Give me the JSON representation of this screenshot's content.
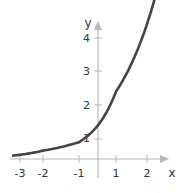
{
  "chart_data": {
    "type": "line",
    "title": "",
    "xlabel": "x",
    "ylabel": "y",
    "xlim": [
      -3.3,
      2.5
    ],
    "ylim": [
      0,
      4.3
    ],
    "grid": false,
    "x_ticks": [
      "-3",
      "-2",
      "-1",
      "1",
      "2"
    ],
    "y_ticks": [
      "1",
      "2",
      "3",
      "4"
    ],
    "series": [
      {
        "name": "y = 2^x",
        "color": "#444444",
        "x": [
          -3.3,
          -3,
          -2.5,
          -2,
          -1.5,
          -1,
          -0.5,
          0,
          0.5,
          1,
          1.5,
          2,
          2.3
        ],
        "values": [
          0.1,
          0.125,
          0.18,
          0.25,
          0.35,
          0.5,
          0.71,
          1,
          1.41,
          2,
          2.83,
          4,
          4.9
        ]
      }
    ]
  },
  "colors": {
    "axis": "#b8b8b8",
    "curve": "#444444",
    "text": "#333333"
  }
}
